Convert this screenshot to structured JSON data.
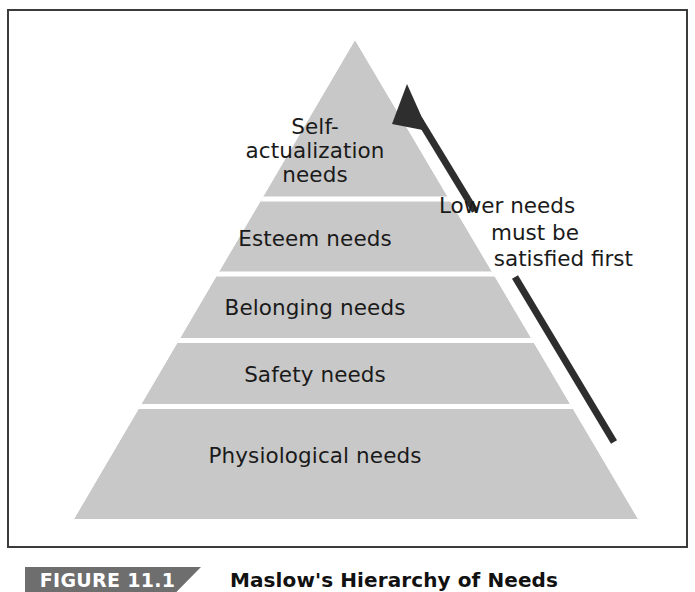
{
  "figure": {
    "caption_badge": "FIGURE 11.1",
    "caption_title": "Maslow's Hierarchy of Needs",
    "frame_border_color": "#3b3b3b",
    "background_color": "#ffffff"
  },
  "diagram": {
    "type": "pyramid",
    "name": "maslow-hierarchy-of-needs",
    "tier_fill_color": "#c8c8c8",
    "tier_divider_color": "#ffffff",
    "text_color": "#1a1a1a",
    "apex": {
      "x": 353,
      "y": 38
    },
    "base_left": {
      "x": 72,
      "y": 517
    },
    "base_right": {
      "x": 636,
      "y": 517
    },
    "tiers": [
      {
        "index": 0,
        "level": 5,
        "label": "Self-\nactualization\nneeds",
        "label_plain": "Self-actualization needs",
        "position": "top"
      },
      {
        "index": 1,
        "level": 4,
        "label": "Esteem needs",
        "label_plain": "Esteem needs",
        "position": "second"
      },
      {
        "index": 2,
        "level": 3,
        "label": "Belonging needs",
        "label_plain": "Belonging needs",
        "position": "middle"
      },
      {
        "index": 3,
        "level": 2,
        "label": "Safety needs",
        "label_plain": "Safety needs",
        "position": "fourth"
      },
      {
        "index": 4,
        "level": 1,
        "label": "Physiological needs",
        "label_plain": "Physiological needs",
        "position": "bottom"
      }
    ],
    "divider_y_values": [
      197,
      272,
      338,
      404
    ]
  },
  "annotation": {
    "name": "lower-needs-note",
    "line1": "Lower needs",
    "line2": "must be",
    "line3": "satisfied first",
    "full_text": "Lower needs must be satisfied first",
    "arrow": {
      "name": "upward-arrow",
      "color": "#2e2e2e",
      "direction": "up-left",
      "tip": {
        "x": 408,
        "y": 91
      },
      "tail": {
        "x": 612,
        "y": 440
      }
    }
  }
}
